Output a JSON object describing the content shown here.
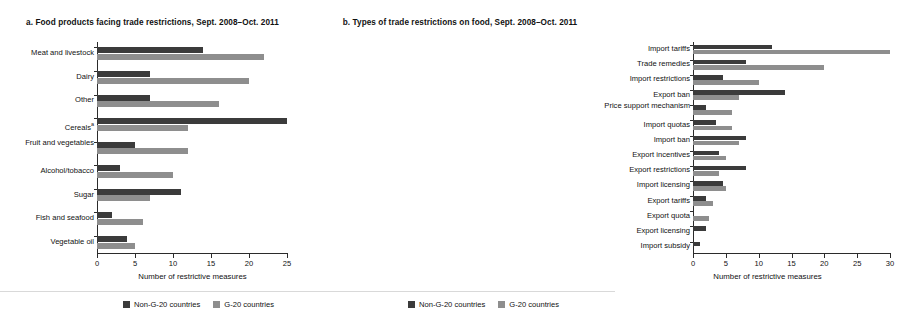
{
  "chart_data": [
    {
      "type": "bar",
      "orientation": "horizontal",
      "panel_label": "a.",
      "title": "a.  Food products facing trade restrictions, Sept. 2008–Oct. 2011",
      "xlabel": "Number of restrictive measures",
      "ylabel": "",
      "xlim": [
        0,
        25
      ],
      "xticks": [
        0,
        5,
        10,
        15,
        20,
        25
      ],
      "grid": false,
      "legend_position": "bottom",
      "categories": [
        "Meat and livestock",
        "Dairy",
        "Other",
        "Cerealsᵃ",
        "Fruit and vegetables",
        "Alcohol/tobacco",
        "Sugar",
        "Fish and seafood",
        "Vegetable oil"
      ],
      "series": [
        {
          "name": "Non-G-20 countries",
          "color": "#3b3b3b",
          "values": [
            14,
            7,
            7,
            25,
            5,
            3,
            11,
            2,
            4
          ]
        },
        {
          "name": "G-20 countries",
          "color": "#8e8e8e",
          "values": [
            22,
            20,
            16,
            12,
            12,
            10,
            7,
            6,
            5
          ]
        }
      ]
    },
    {
      "type": "bar",
      "orientation": "horizontal",
      "panel_label": "b.",
      "title": "b.  Types of trade restrictions on food, Sept. 2008–Oct. 2011",
      "xlabel": "Number of restrictive measures",
      "ylabel": "",
      "xlim": [
        0,
        30
      ],
      "xticks": [
        0,
        5,
        10,
        15,
        20,
        25,
        30
      ],
      "grid": false,
      "legend_position": "bottom",
      "categories": [
        "Import tariffs",
        "Trade remedies",
        "Import restrictions",
        "Export ban",
        "Price support mechanism",
        "Import quotas",
        "Import ban",
        "Export incentives",
        "Export restrictions",
        "Import licensing",
        "Export tariffs",
        "Export quota",
        "Export licensing",
        "Import subsidy"
      ],
      "series": [
        {
          "name": "Non-G-20 countries",
          "color": "#3b3b3b",
          "values": [
            12,
            8,
            4.5,
            14,
            2,
            3.5,
            8,
            4,
            8,
            4.5,
            2,
            0,
            2,
            1
          ]
        },
        {
          "name": "G-20 countries",
          "color": "#8e8e8e",
          "values": [
            30,
            20,
            10,
            7,
            6,
            6,
            7,
            5,
            4,
            5,
            3,
            2.5,
            0,
            0
          ]
        }
      ]
    }
  ],
  "panel_a": {
    "title": "a.  Food products facing trade restrictions, Sept. 2008–Oct. 2011",
    "xaxis_title": "Number of restrictive measures",
    "xticks": [
      "0",
      "5",
      "10",
      "15",
      "20",
      "25"
    ],
    "categories": [
      {
        "label": "Meat and livestock",
        "footnote": ""
      },
      {
        "label": "Dairy",
        "footnote": ""
      },
      {
        "label": "Other",
        "footnote": ""
      },
      {
        "label": "Cereals",
        "footnote": "a"
      },
      {
        "label": "Fruit and vegetables",
        "footnote": ""
      },
      {
        "label": "Alcohol/tobacco",
        "footnote": ""
      },
      {
        "label": "Sugar",
        "footnote": ""
      },
      {
        "label": "Fish and seafood",
        "footnote": ""
      },
      {
        "label": "Vegetable oil",
        "footnote": ""
      }
    ],
    "legend": [
      {
        "label": "Non-G-20 countries",
        "color": "#3b3b3b"
      },
      {
        "label": "G-20 countries",
        "color": "#8e8e8e"
      }
    ]
  },
  "panel_b": {
    "title": "b.  Types of trade restrictions on food, Sept. 2008–Oct. 2011",
    "xaxis_title": "Number of restrictive measures",
    "xticks": [
      "0",
      "5",
      "10",
      "15",
      "20",
      "25",
      "30"
    ],
    "categories": [
      {
        "label": "Import tariffs",
        "footnote": ""
      },
      {
        "label": "Trade remedies",
        "footnote": ""
      },
      {
        "label": "Import restrictions",
        "footnote": ""
      },
      {
        "label": "Export ban",
        "footnote": ""
      },
      {
        "label": "Price support mechanism",
        "footnote": ""
      },
      {
        "label": "Import quotas",
        "footnote": ""
      },
      {
        "label": "Import ban",
        "footnote": ""
      },
      {
        "label": "Export incentives",
        "footnote": ""
      },
      {
        "label": "Export restrictions",
        "footnote": ""
      },
      {
        "label": "Import licensing",
        "footnote": ""
      },
      {
        "label": "Export tariffs",
        "footnote": ""
      },
      {
        "label": "Export quota",
        "footnote": ""
      },
      {
        "label": "Export licensing",
        "footnote": ""
      },
      {
        "label": "Import subsidy",
        "footnote": ""
      }
    ],
    "legend": [
      {
        "label": "Non-G-20 countries",
        "color": "#3b3b3b"
      },
      {
        "label": "G-20 countries",
        "color": "#8e8e8e"
      }
    ]
  }
}
